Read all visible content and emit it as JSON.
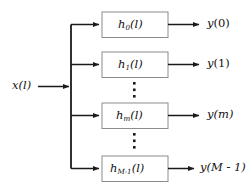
{
  "diagram": {
    "input": {
      "name": "x",
      "arg": "(l)",
      "label": "x(l)"
    },
    "branches": [
      {
        "block": {
          "base": "h",
          "sub": "0",
          "arg": "(l)",
          "label": "h0(l)"
        },
        "output": {
          "base": "y",
          "arg": "(0)",
          "label": "y(0)"
        }
      },
      {
        "block": {
          "base": "h",
          "sub": "1",
          "arg": "(l)",
          "label": "h1(l)"
        },
        "output": {
          "base": "y",
          "arg": "(1)",
          "label": "y(1)"
        }
      },
      {
        "block": {
          "base": "h",
          "sub": "m",
          "arg": "(l)",
          "label": "hm(l)"
        },
        "output": {
          "base": "y",
          "arg": "(m)",
          "label": "y(m)"
        }
      },
      {
        "block": {
          "base": "h",
          "sub": "M-1",
          "arg": "(l)",
          "label": "hM-1(l)"
        },
        "output": {
          "base": "y",
          "arg": "(M - 1)",
          "label": "y(M-1)"
        }
      }
    ],
    "ellipses": [
      {
        "name": "ellipsis-upper",
        "dots": "•••"
      },
      {
        "name": "ellipsis-lower",
        "dots": "•••"
      }
    ],
    "colors": {
      "line": "#1a1a1a",
      "box_border": "#8c8c8c",
      "box_fill": "#ffffff",
      "text": "#111111",
      "background": "#ffffff"
    }
  }
}
